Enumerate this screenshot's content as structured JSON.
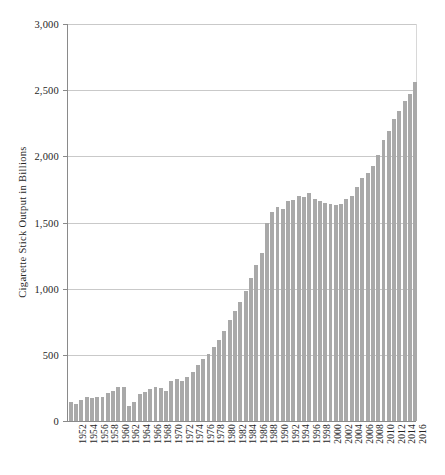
{
  "chart_data": {
    "type": "bar",
    "title": "",
    "subtitle": "",
    "xlabel": "",
    "ylabel": "Cigarette Stick Output in Billions",
    "ylim": [
      0,
      3000
    ],
    "ytick_values": [
      0,
      500,
      1000,
      1500,
      2000,
      2500,
      3000
    ],
    "ytick_labels": [
      "0",
      "500",
      "1,000",
      "1,500",
      "2,000",
      "2,500",
      "3,000"
    ],
    "grid": true,
    "legend": null,
    "legend_position": "none",
    "bar_color": "#a9a9a9",
    "xtick_step": 2,
    "xtick_labels": [
      "1952",
      "1954",
      "1956",
      "1958",
      "1960",
      "1962",
      "1964",
      "1966",
      "1968",
      "1970",
      "1972",
      "1974",
      "1976",
      "1978",
      "1980",
      "1982",
      "1984",
      "1986",
      "1988",
      "1990",
      "1992",
      "1994",
      "1996",
      "1998",
      "2000",
      "2002",
      "2004",
      "2006",
      "2008",
      "2010",
      "2012",
      "2014",
      "2016"
    ],
    "categories": [
      "1951",
      "1952",
      "1953",
      "1954",
      "1955",
      "1956",
      "1957",
      "1958",
      "1959",
      "1960",
      "1961",
      "1962",
      "1963",
      "1964",
      "1965",
      "1966",
      "1967",
      "1968",
      "1969",
      "1970",
      "1971",
      "1972",
      "1973",
      "1974",
      "1975",
      "1976",
      "1977",
      "1978",
      "1979",
      "1980",
      "1981",
      "1982",
      "1983",
      "1984",
      "1985",
      "1986",
      "1987",
      "1988",
      "1989",
      "1990",
      "1991",
      "1992",
      "1993",
      "1994",
      "1995",
      "1996",
      "1997",
      "1998",
      "1999",
      "2000",
      "2001",
      "2002",
      "2003",
      "2004",
      "2005",
      "2006",
      "2007",
      "2008",
      "2009",
      "2010",
      "2011",
      "2012",
      "2013",
      "2014",
      "2015",
      "2016"
    ],
    "values": [
      145,
      130,
      160,
      185,
      175,
      185,
      180,
      215,
      230,
      260,
      255,
      110,
      140,
      205,
      220,
      240,
      255,
      250,
      230,
      300,
      320,
      300,
      330,
      370,
      420,
      465,
      510,
      560,
      610,
      680,
      760,
      830,
      900,
      980,
      1080,
      1180,
      1270,
      1500,
      1580,
      1620,
      1600,
      1660,
      1670,
      1700,
      1690,
      1720,
      1675,
      1660,
      1645,
      1640,
      1635,
      1640,
      1675,
      1700,
      1770,
      1840,
      1875,
      1930,
      2010,
      2125,
      2195,
      2280,
      2340,
      2420,
      2470,
      2560
    ],
    "series_name": "Cigarette Stick Output"
  }
}
